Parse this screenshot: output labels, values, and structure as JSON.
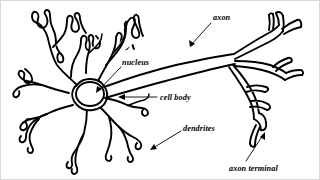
{
  "figure": {
    "background_color": "#ffffff",
    "line_color": "#000000",
    "border_color": "#d8d8d8"
  },
  "labels": {
    "axon": "axon",
    "nucleus": "nucleus",
    "cell_body": "cell body",
    "dendrites": "dendrites",
    "axon_terminal": "axon terminal"
  },
  "parts": {
    "dendrite_tree": "dendrite-tree",
    "soma": "cell-body-soma",
    "nucleus": "nucleus",
    "axon": "axon",
    "axon_terminal": "axon-terminal-arbor"
  }
}
